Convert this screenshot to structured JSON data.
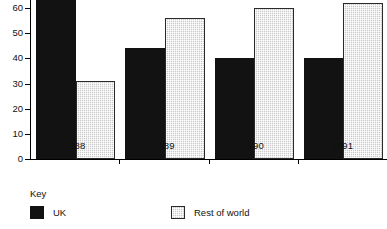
{
  "chart_data": {
    "type": "bar",
    "title": "",
    "subtitle": "",
    "xlabel": "",
    "ylabel": "",
    "categories": [
      "1988",
      "1989",
      "1990",
      "1991"
    ],
    "series": [
      {
        "name": "UK",
        "color": "#121212",
        "values": [
          72,
          44,
          40,
          40
        ]
      },
      {
        "name": "Rest of world",
        "color": "#c9c9c9",
        "values": [
          31,
          56,
          60,
          62
        ]
      }
    ],
    "ylim": [
      0,
      72
    ],
    "yticks": [
      0,
      10,
      20,
      30,
      40,
      50,
      60
    ],
    "ytick_labels": [
      "0",
      "10",
      "20",
      "30",
      "40",
      "50",
      "60"
    ],
    "grid": false,
    "legend_position": "bottom-left",
    "note_top_cropped": "first UK bar extends above the visible image edge"
  },
  "legend": {
    "title": "Key",
    "entries": [
      {
        "label": "UK",
        "swatch": "solid-black-swatch"
      },
      {
        "label": "Rest of world",
        "swatch": "light-gray-hatched-swatch"
      }
    ]
  }
}
